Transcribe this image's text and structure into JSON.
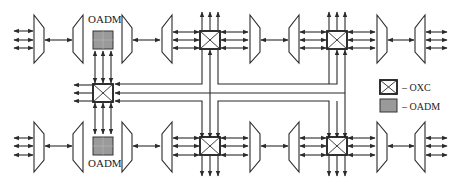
{
  "diagram": {
    "title": "",
    "labels": {
      "oadm_top": "OADM",
      "oadm_bottom": "OADM"
    },
    "legend": {
      "items": [
        {
          "symbol": "oxc-box",
          "label": "– OXC"
        },
        {
          "symbol": "oadm-box",
          "label": "– OADM"
        }
      ]
    },
    "colors": {
      "line": "#2a2a2a",
      "oadm_fill": "#9a9a9a",
      "background": "#ffffff"
    },
    "rings": [
      {
        "name": "top-line",
        "nodes": [
          "demux",
          "mux",
          "OADM",
          "demux",
          "mux",
          "OXC",
          "demux",
          "mux",
          "OXC",
          "demux",
          "mux"
        ]
      },
      {
        "name": "bottom-line",
        "nodes": [
          "demux",
          "mux",
          "OADM",
          "demux",
          "mux",
          "OXC",
          "demux",
          "mux",
          "OXC",
          "demux",
          "mux"
        ]
      }
    ],
    "cross_connect_left": "OXC"
  }
}
